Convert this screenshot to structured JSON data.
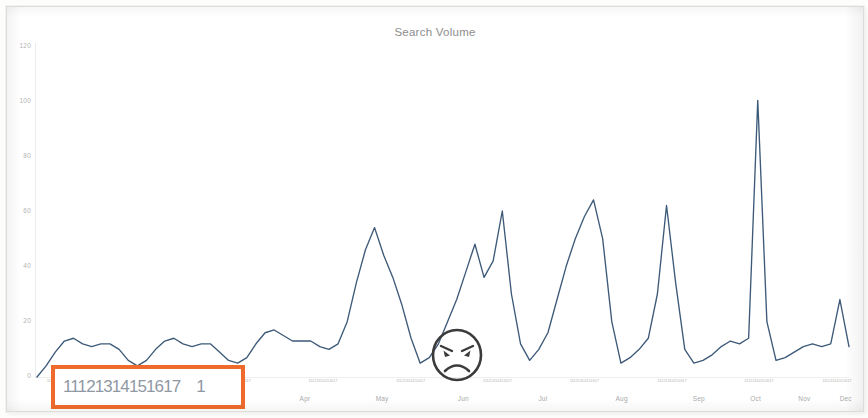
{
  "chart_data": {
    "type": "line",
    "title": "Search Volume",
    "xlabel": "",
    "ylabel": "",
    "ylim": [
      0,
      120
    ],
    "grid": false,
    "legend": null,
    "line_color": "#3d5a78",
    "y_ticks": [
      "120",
      "100",
      "80",
      "60",
      "40",
      "20",
      "0"
    ],
    "y_tick_values": [
      120,
      100,
      80,
      60,
      40,
      20,
      0
    ],
    "month_labels": [
      "Apr",
      "May",
      "Jun",
      "Jul",
      "Aug",
      "Sep",
      "Oct",
      "Nov",
      "Dec"
    ],
    "day_tick_group": "11121314151617",
    "day_tick_groups": [
      "11121314151617",
      "11121314151617",
      "11121314151617",
      "11121314151617",
      "11121314151617",
      "11121314151617",
      "11121314151617",
      "11121314151617",
      "11121314151617",
      "11121314151617"
    ],
    "series": [
      {
        "name": "Search Volume",
        "x": [
          0,
          1,
          2,
          3,
          4,
          5,
          6,
          7,
          8,
          9,
          10,
          11,
          12,
          13,
          14,
          15,
          16,
          17,
          18,
          19,
          20,
          21,
          22,
          23,
          24,
          25,
          26,
          27,
          28,
          29,
          30,
          31,
          32,
          33,
          34,
          35,
          36,
          37,
          38,
          39,
          40,
          41,
          42,
          43,
          44,
          45,
          46,
          47,
          48,
          49,
          50,
          51,
          52,
          53,
          54,
          55,
          56,
          57,
          58,
          59,
          60,
          61,
          62,
          63,
          64,
          65,
          66,
          67,
          68,
          69,
          70,
          71,
          72,
          73,
          74,
          75,
          76,
          77,
          78,
          79,
          80,
          81,
          82,
          83,
          84,
          85,
          86,
          87,
          88,
          89
        ],
        "values": [
          0,
          4,
          9,
          13,
          14,
          12,
          11,
          12,
          12,
          10,
          6,
          4,
          6,
          10,
          13,
          14,
          12,
          11,
          12,
          12,
          9,
          6,
          5,
          7,
          12,
          16,
          17,
          15,
          13,
          13,
          13,
          11,
          10,
          12,
          20,
          34,
          46,
          54,
          44,
          36,
          26,
          14,
          5,
          7,
          12,
          20,
          28,
          38,
          48,
          36,
          42,
          60,
          30,
          12,
          6,
          10,
          16,
          28,
          40,
          50,
          58,
          64,
          50,
          20,
          5,
          7,
          10,
          14,
          30,
          62,
          34,
          10,
          5,
          6,
          8,
          11,
          13,
          12,
          14,
          100,
          20,
          6,
          7,
          9,
          11,
          12,
          11,
          12,
          28,
          11
        ]
      }
    ],
    "annotations": [
      {
        "type": "angry-face-emoji",
        "x_month": "Jul",
        "note": "hand-drawn angry face circled near the Jul/Aug low point"
      },
      {
        "type": "highlight-rectangle",
        "color": "#ef6a2b",
        "target": "x-axis day tick labels"
      }
    ]
  }
}
